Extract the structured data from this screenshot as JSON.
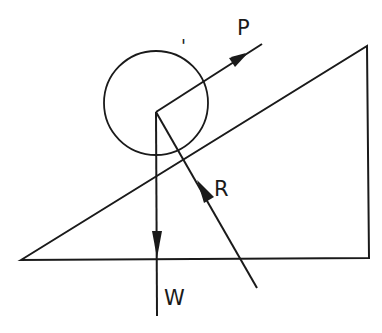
{
  "diagram": {
    "type": "force diagram",
    "labels": {
      "P": "P",
      "R": "R",
      "W": "W",
      "tick_mark": "'"
    },
    "colors": {
      "stroke": "#1a1a1a",
      "background": "#ffffff"
    }
  }
}
